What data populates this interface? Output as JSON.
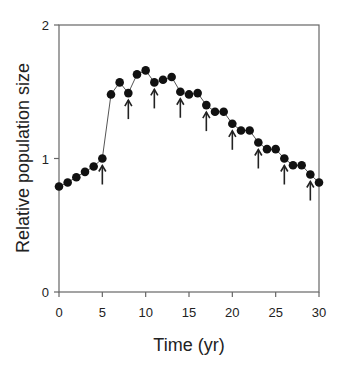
{
  "chart_data": {
    "type": "line",
    "title": "",
    "xlabel": "Time (yr)",
    "ylabel": "Relative population size",
    "xlim": [
      0,
      30
    ],
    "ylim": [
      0,
      2
    ],
    "xticks": [
      0,
      5,
      10,
      15,
      20,
      25,
      30
    ],
    "yticks": [
      0,
      1,
      2
    ],
    "grid": false,
    "legend": null,
    "series": [
      {
        "name": "Relative population size",
        "marker": "filled-circle",
        "x": [
          0,
          1,
          2,
          3,
          4,
          5,
          6,
          7,
          8,
          9,
          10,
          11,
          12,
          13,
          14,
          15,
          16,
          17,
          18,
          19,
          20,
          21,
          22,
          23,
          24,
          25,
          26,
          27,
          28,
          29,
          30
        ],
        "values": [
          0.79,
          0.82,
          0.86,
          0.9,
          0.94,
          1.0,
          1.48,
          1.57,
          1.49,
          1.63,
          1.66,
          1.57,
          1.59,
          1.61,
          1.5,
          1.48,
          1.49,
          1.4,
          1.35,
          1.35,
          1.26,
          1.21,
          1.21,
          1.12,
          1.07,
          1.07,
          1.0,
          0.95,
          0.95,
          0.88,
          0.82
        ]
      }
    ],
    "annotations": {
      "type": "upward-arrows-below-points",
      "x": [
        5,
        8,
        11,
        14,
        17,
        20,
        23,
        26,
        29
      ]
    }
  },
  "colors": {
    "line": "#555555",
    "marker": "#111111",
    "axis": "#666666",
    "arrow": "#222222"
  }
}
